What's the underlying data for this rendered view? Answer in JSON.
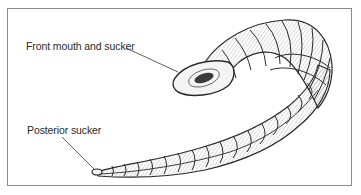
{
  "figure": {
    "labels": {
      "front": "Front mouth and sucker",
      "posterior": "Posterior sucker"
    },
    "colors": {
      "border": "#8a8a8a",
      "ink": "#2a2a2a",
      "background": "#ffffff"
    }
  }
}
